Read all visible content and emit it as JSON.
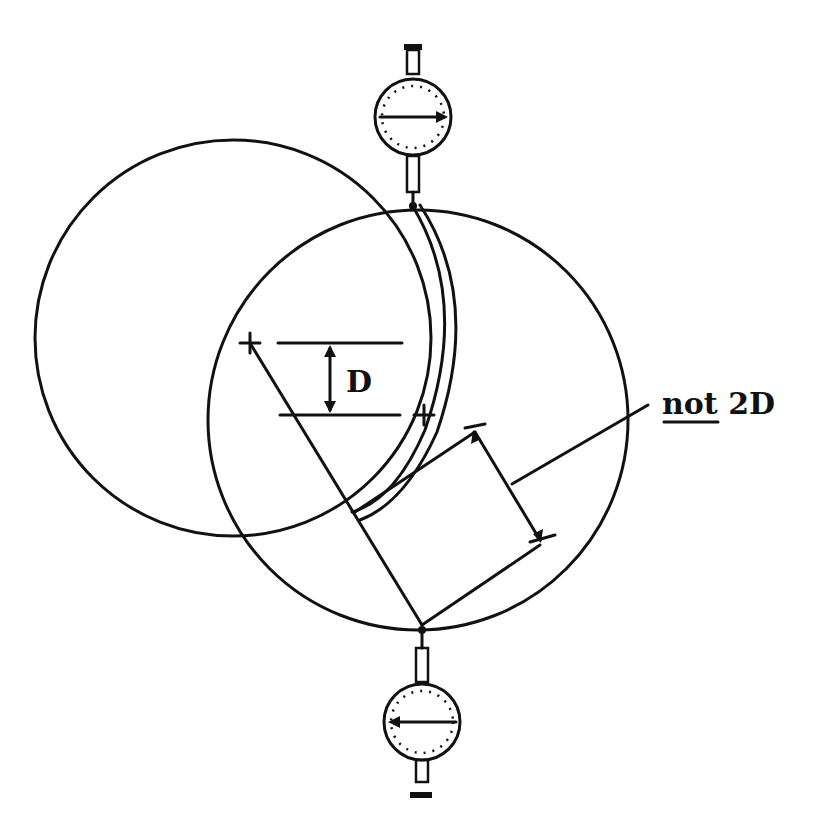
{
  "diagram": {
    "title": "",
    "labels": {
      "offset_label": "D",
      "note_prefix": "not",
      "note_suffix": " 2D"
    },
    "colors": {
      "ink": "#111111",
      "background": "#ffffff"
    },
    "elements": {
      "left_circle": {
        "cx": 233,
        "cy": 338,
        "r": 198
      },
      "right_circle": {
        "cx": 418,
        "cy": 420,
        "r": 210
      },
      "center_mark_a": {
        "x": 250,
        "y": 343
      },
      "center_mark_b": {
        "x": 424,
        "y": 415
      },
      "top_indicator": {
        "cx": 413,
        "cy": 117,
        "r": 38,
        "arrow_direction": "right"
      },
      "bottom_indicator": {
        "cx": 422,
        "cy": 722,
        "r": 38,
        "arrow_direction": "left"
      }
    }
  }
}
